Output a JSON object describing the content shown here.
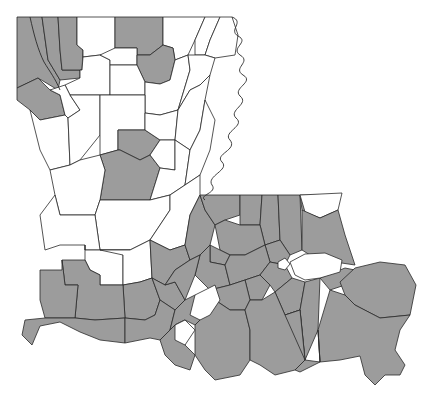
{
  "map": {
    "subject": "Louisiana parishes",
    "legend_visible": false,
    "colors": {
      "shaded": "#9c9c9c",
      "unshaded": "#ffffff",
      "border": "#2a2a2a",
      "background": "#ffffff"
    },
    "parishes": [
      {
        "id": "caddo",
        "shaded": true,
        "points": "17,17 42,17 48,60 60,80 58,90 38,78 17,88"
      },
      {
        "id": "bossier",
        "shaded": true,
        "points": "42,17 58,17 60,50 62,70 80,70 80,78 60,80 48,60"
      },
      {
        "id": "webster",
        "shaded": true,
        "points": "58,17 77,17 77,45 83,50 82,70 62,70 60,50"
      },
      {
        "id": "claiborne",
        "shaded": false,
        "points": "77,17 115,17 115,55 100,55 83,57 83,50 77,45"
      },
      {
        "id": "union",
        "shaded": true,
        "points": "115,17 163,17 163,45 150,55 137,55 137,48 115,48"
      },
      {
        "id": "morehouse",
        "shaded": false,
        "points": "163,17 205,17 195,40 188,55 175,60 173,48 163,45"
      },
      {
        "id": "west-carroll",
        "shaded": false,
        "points": "205,17 220,17 210,40 205,55 195,55 195,40"
      },
      {
        "id": "east-carroll",
        "shaded": false,
        "points": "220,17 232,17 238,35 235,55 215,58 205,55 210,40"
      },
      {
        "id": "de-soto",
        "shaded": true,
        "points": "17,88 38,78 50,90 60,95 65,115 40,120 30,110 17,100"
      },
      {
        "id": "bienville",
        "shaded": false,
        "points": "83,57 100,55 110,60 110,95 70,95 65,85 80,78 80,70 82,70"
      },
      {
        "id": "lincoln",
        "shaded": false,
        "points": "100,55 115,48 137,48 137,65 110,65 110,60"
      },
      {
        "id": "ouachita",
        "shaded": true,
        "points": "137,55 150,55 163,45 173,48 175,60 170,80 160,84 145,82 137,65"
      },
      {
        "id": "jackson",
        "shaded": false,
        "points": "110,65 137,65 145,82 145,95 110,95"
      },
      {
        "id": "richland",
        "shaded": false,
        "points": "160,84 170,80 175,60 188,55 190,70 178,110 160,115 145,113 145,95 145,82"
      },
      {
        "id": "madison",
        "shaded": false,
        "points": "188,55 205,55 215,58 210,75 200,85 190,90 178,110 190,70"
      },
      {
        "id": "red-river",
        "shaded": false,
        "points": "50,90 65,85 70,95 80,110 68,118 65,115 60,95"
      },
      {
        "id": "sabine",
        "shaded": false,
        "points": "30,110 40,120 65,115 68,118 70,165 50,170 40,150 35,130"
      },
      {
        "id": "natchitoches",
        "shaded": false,
        "points": "68,118 80,110 70,95 100,95 100,135 80,160 70,165"
      },
      {
        "id": "winn",
        "shaded": false,
        "points": "100,95 110,95 145,95 145,130 118,130 118,150 100,155 100,135"
      },
      {
        "id": "caldwell",
        "shaded": true,
        "points": "118,130 145,130 160,140 150,155 140,160 120,150 118,150"
      },
      {
        "id": "franklin",
        "shaded": false,
        "points": "145,113 160,115 178,110 175,140 160,140 145,130"
      },
      {
        "id": "tensas",
        "shaded": false,
        "points": "178,110 190,90 200,85 210,75 205,100 200,130 190,150 175,140"
      },
      {
        "id": "grant",
        "shaded": true,
        "points": "100,155 118,150 120,150 140,160 150,155 160,168 150,200 100,200 105,170"
      },
      {
        "id": "la-salle",
        "shaded": false,
        "points": "150,155 160,140 175,140 175,170 160,168"
      },
      {
        "id": "catahoula",
        "shaded": false,
        "points": "160,168 175,170 175,140 190,150 185,185 170,195 150,200"
      },
      {
        "id": "concordia",
        "shaded": false,
        "points": "190,150 200,130 205,100 215,120 210,150 200,175 185,185"
      },
      {
        "id": "vernon",
        "shaded": false,
        "points": "50,170 70,165 80,160 100,155 105,170 100,200 95,215 60,215 55,195"
      },
      {
        "id": "rapides",
        "shaded": false,
        "points": "100,200 150,200 170,195 170,210 150,240 130,250 100,250 95,215"
      },
      {
        "id": "avoyelles",
        "shaded": false,
        "points": "170,195 185,185 200,175 200,195 190,215 185,245 170,250 150,240 170,210"
      },
      {
        "id": "beauregard",
        "shaded": false,
        "points": "55,195 60,215 95,215 100,250 85,250 85,245 60,245 45,250 40,215"
      },
      {
        "id": "allen",
        "shaded": false,
        "points": "85,245 85,250 100,250 130,250 123,255 123,285 100,285 100,275 90,270 85,260"
      },
      {
        "id": "evangeline",
        "shaded": false,
        "points": "100,250 130,250 150,240 152,278 140,282 123,285 123,255"
      },
      {
        "id": "st-landry",
        "shaded": true,
        "points": "150,240 170,250 185,245 190,260 175,270 165,285 152,278"
      },
      {
        "id": "pointe-coupee",
        "shaded": true,
        "points": "185,245 190,215 200,195 205,210 215,225 210,245 200,255 190,260"
      },
      {
        "id": "west-feliciana",
        "shaded": true,
        "points": "200,195 240,195 240,215 225,220 215,225 205,210"
      },
      {
        "id": "east-feliciana",
        "shaded": true,
        "points": "240,195 262,195 260,225 240,225 240,215"
      },
      {
        "id": "st-helena",
        "shaded": true,
        "points": "262,195 278,195 280,240 265,245 260,225"
      },
      {
        "id": "tangipahoa",
        "shaded": true,
        "points": "278,195 300,195 302,250 290,255 280,240"
      },
      {
        "id": "washington",
        "shaded": true,
        "points": "300,195 340,195 330,215 320,220 305,215 302,210"
      },
      {
        "id": "washington-white",
        "shaded": false,
        "points": "300,195 342,193 338,210 320,218 305,212"
      },
      {
        "id": "st-tammany",
        "shaded": true,
        "points": "302,210 320,218 338,210 345,235 355,265 335,262 310,255 302,250"
      },
      {
        "id": "east-baton-rouge",
        "shaded": true,
        "points": "215,225 225,220 240,225 260,225 265,245 245,255 230,255 220,250"
      },
      {
        "id": "livingston",
        "shaded": true,
        "points": "265,245 280,240 290,255 285,265 270,262"
      },
      {
        "id": "west-baton-rouge",
        "shaded": true,
        "points": "210,245 220,250 230,255 225,265 210,262"
      },
      {
        "id": "iberville",
        "shaded": true,
        "points": "200,255 210,245 210,262 225,265 230,285 210,290 195,275"
      },
      {
        "id": "ascension",
        "shaded": true,
        "points": "230,255 245,255 265,245 270,262 260,275 245,280 230,285 225,265"
      },
      {
        "id": "st-james",
        "shaded": true,
        "points": "245,280 260,275 270,285 262,300 250,300"
      },
      {
        "id": "st-john",
        "shaded": true,
        "points": "260,275 270,262 285,265 292,278 275,292 270,285"
      },
      {
        "id": "st-charles",
        "shaded": true,
        "points": "275,292 292,278 305,282 300,310 285,315"
      },
      {
        "id": "jefferson",
        "shaded": true,
        "points": "305,282 320,278 318,330 305,360 300,310"
      },
      {
        "id": "orleans",
        "shaded": true,
        "points": "320,278 345,268 355,270 345,285 330,290"
      },
      {
        "id": "st-bernard",
        "shaded": true,
        "points": "340,282 355,268 380,262 405,265 416,285 410,315 380,318 355,305 345,295"
      },
      {
        "id": "plaquemines",
        "shaded": true,
        "points": "318,330 330,290 345,295 355,305 380,318 410,315 400,330 395,350 405,365 400,375 385,375 375,385 365,375 360,356 340,360 320,362"
      },
      {
        "id": "acadia",
        "shaded": true,
        "points": "123,285 140,282 152,278 160,300 155,315 145,320 125,318"
      },
      {
        "id": "lafayette",
        "shaded": true,
        "points": "152,278 165,285 175,282 185,300 175,310 160,300"
      },
      {
        "id": "st-martin-n",
        "shaded": true,
        "points": "175,270 190,260 200,255 195,275 185,300 175,282 165,285"
      },
      {
        "id": "jeff-davis",
        "shaded": true,
        "points": "85,260 90,270 100,275 100,285 123,285 125,318 95,320 75,318 78,285 65,285 62,260 80,260"
      },
      {
        "id": "calcasieu",
        "shaded": true,
        "points": "40,270 62,270 62,260 65,285 78,285 75,318 45,318 40,300"
      },
      {
        "id": "cameron",
        "shaded": true,
        "points": "25,320 45,318 75,318 95,320 125,318 125,343 100,340 80,332 60,322 40,326 32,345 22,335"
      },
      {
        "id": "vermilion",
        "shaded": true,
        "points": "125,318 145,320 155,315 160,300 175,310 170,330 160,340 150,338 140,340 125,343"
      },
      {
        "id": "iberia",
        "shaded": true,
        "points": "170,330 175,310 185,300 195,295 205,300 200,320 195,325 185,320 175,325"
      },
      {
        "id": "st-mary-w",
        "shaded": true,
        "points": "170,330 175,325 185,320 185,345 195,355 190,370 175,365 165,355 160,340"
      },
      {
        "id": "assumption",
        "shaded": true,
        "points": "210,290 230,285 245,280 250,300 245,310 230,310 215,300"
      },
      {
        "id": "st-mary",
        "shaded": true,
        "points": "195,325 200,320 205,300 215,300 230,310 245,310 250,330 250,360 240,375 215,380 205,370 195,355"
      },
      {
        "id": "terrebonne",
        "shaded": true,
        "points": "250,300 262,300 275,292 285,315 300,310 305,360 295,370 275,375 260,365 250,360 250,330 245,310"
      },
      {
        "id": "lafourche",
        "shaded": true,
        "points": "285,315 300,310 305,360 320,362 318,330 320,362 300,372 295,370 305,360"
      }
    ],
    "lakes": [
      {
        "id": "lake-pontchartrain",
        "points": "290,262 305,254 325,253 342,260 340,272 320,278 305,280 295,275"
      },
      {
        "id": "lake-maurepas",
        "points": "278,262 285,258 290,264 285,270 278,268"
      }
    ],
    "unshaded_pockets": [
      {
        "id": "st-martin-lower-white",
        "points": "195,295 215,285 220,300 210,315 200,320 190,315"
      },
      {
        "id": "cameron-white-inlet",
        "points": "175,325 185,320 195,330 185,345 175,340"
      }
    ]
  }
}
